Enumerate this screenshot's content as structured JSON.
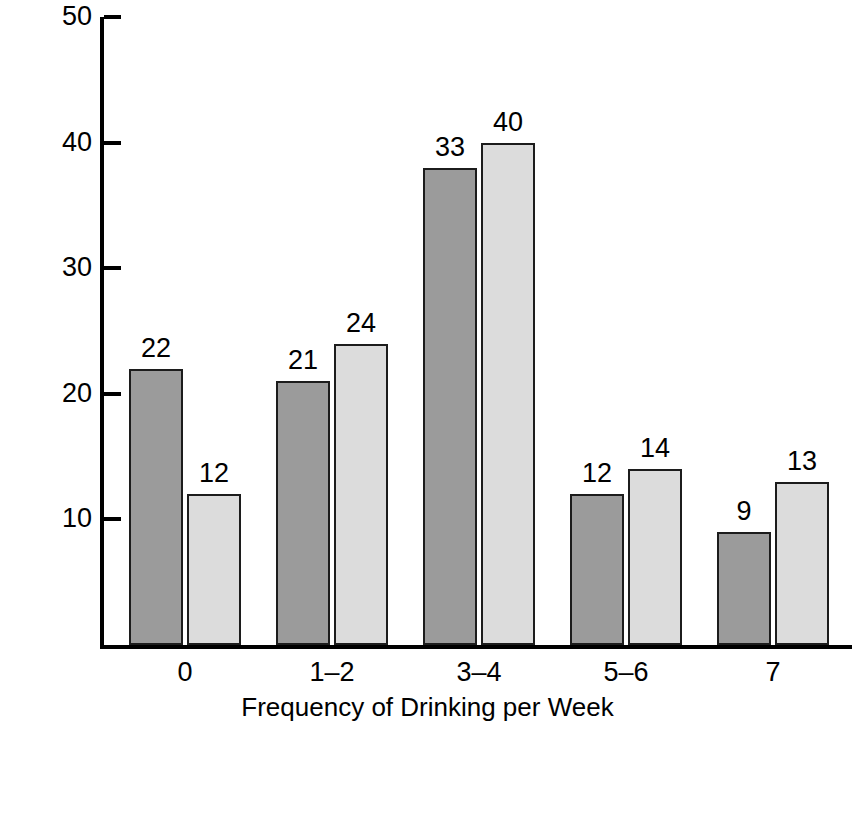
{
  "chart_data": {
    "type": "bar",
    "title": "",
    "xlabel": "Frequency of Drinking per Week",
    "ylabel": "Percentage of Students",
    "categories": [
      "0",
      "1–2",
      "3–4",
      "5–6",
      "7"
    ],
    "series": [
      {
        "name": "Underage",
        "values": [
          22,
          21,
          33,
          12,
          9
        ],
        "drawn_values": [
          22,
          21,
          38,
          12,
          9
        ],
        "color": "#9b9b9b"
      },
      {
        "name": "Legal",
        "values": [
          12,
          24,
          40,
          14,
          13
        ],
        "drawn_values": [
          12,
          24,
          40,
          14,
          13
        ],
        "color": "#dcdcdc"
      }
    ],
    "ylim": [
      0,
      50
    ],
    "yticks": [
      10,
      20,
      30,
      40,
      50
    ],
    "ytick_labels": [
      "10",
      "20",
      "30",
      "40",
      "50"
    ],
    "grid": false,
    "legend_position": "bottom-left",
    "data_labels": true,
    "colors": {
      "underage": "#9b9b9b",
      "legal": "#dcdcdc",
      "axis": "#000000",
      "bar_outline": "#1c1c1c",
      "background": "#ffffff"
    }
  },
  "legend": {
    "entries": [
      {
        "label": "Underage",
        "swatch": "underage"
      },
      {
        "label": "Legal",
        "swatch": "legal"
      }
    ]
  }
}
